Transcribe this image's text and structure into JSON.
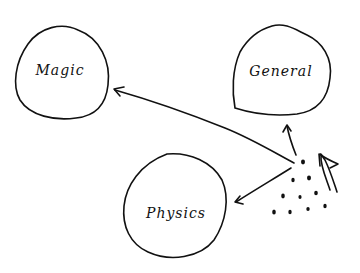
{
  "diagram": {
    "style": "hand-drawn sketch",
    "ink_color": "#111111",
    "background": "#ffffff",
    "nodes": [
      {
        "id": "magic",
        "label": "Magic",
        "cx": 58,
        "cy": 75,
        "rx": 47,
        "ry": 48
      },
      {
        "id": "general",
        "label": "General",
        "cx": 283,
        "cy": 75,
        "rx": 50,
        "ry": 45
      },
      {
        "id": "physics",
        "label": "Physics",
        "cx": 174,
        "cy": 210,
        "rx": 51,
        "ry": 48
      }
    ],
    "particles": {
      "description": "cluster of dots (particles)",
      "count": 11
    },
    "edges": [
      {
        "from": "particles",
        "to": "magic",
        "type": "arrow"
      },
      {
        "from": "particles",
        "to": "general",
        "type": "arrow"
      },
      {
        "from": "particles",
        "to": "physics",
        "type": "arrow"
      },
      {
        "from": "outside",
        "to": "particles",
        "type": "incoming-large-arrow"
      }
    ]
  }
}
